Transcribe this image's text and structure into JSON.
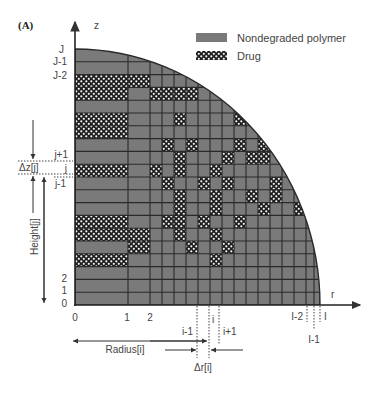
{
  "figure": {
    "panel_label": "(A)",
    "axis_z_label": "z",
    "axis_r_label": "r"
  },
  "legend": {
    "items": [
      {
        "label": "Nondegraded polymer",
        "swatch": "polymer"
      },
      {
        "label": "Drug",
        "swatch": "drug"
      }
    ]
  },
  "colors": {
    "polymer": "#7a7a7a",
    "grid": "#2a2a2a",
    "drug_dark": "#1e1e1e",
    "drug_light": "#f2f2f2",
    "text": "#444444"
  },
  "z_labels": {
    "top": [
      "J",
      "J-1",
      "J-2"
    ],
    "middle": [
      "j+1",
      "j",
      "j-1"
    ],
    "bottom": [
      "2",
      "1",
      "0"
    ]
  },
  "r_labels": {
    "near_origin": [
      "0",
      "1",
      "2"
    ],
    "middle": [
      "i-1",
      "i",
      "i+1"
    ],
    "outer": [
      "I-2",
      "I-1",
      "I"
    ]
  },
  "annotations": {
    "delta_z": "Δz[j]",
    "height": "Height[j]",
    "radius": "Radius[i]",
    "delta_r": "Δr[i]"
  },
  "grid": {
    "origin_x": 75,
    "origin_y": 305,
    "outer_radius_x": 245,
    "outer_radius_y": 256,
    "rows": 20,
    "col_edges": [
      75,
      128,
      150,
      162,
      174,
      186,
      198,
      210,
      222,
      234,
      246,
      258,
      270,
      282,
      294,
      306,
      314,
      320
    ],
    "drug_cells": [
      [
        1,
        17
      ],
      [
        1,
        14
      ],
      [
        1,
        12
      ],
      [
        1,
        11
      ],
      [
        1,
        9
      ],
      [
        1,
        5
      ],
      [
        2,
        1
      ],
      [
        2,
        0
      ],
      [
        2,
        17
      ],
      [
        4,
        14
      ],
      [
        4,
        11
      ],
      [
        3,
        10
      ],
      [
        4,
        10
      ],
      [
        3,
        9
      ],
      [
        5,
        12
      ],
      [
        5,
        16
      ],
      [
        6,
        16
      ],
      [
        6,
        18
      ],
      [
        9,
        15
      ],
      [
        12,
        14
      ],
      [
        3,
        5
      ],
      [
        3,
        4
      ],
      [
        3,
        3
      ],
      [
        3,
        2
      ],
      [
        5,
        4
      ],
      [
        7,
        3
      ],
      [
        9,
        2
      ],
      [
        5,
        9
      ],
      [
        8,
        8
      ],
      [
        9,
        7
      ],
      [
        10,
        6
      ],
      [
        11,
        10
      ],
      [
        6,
        12
      ],
      [
        7,
        11
      ],
      [
        8,
        10
      ],
      [
        8,
        11
      ],
      [
        10,
        12
      ],
      [
        11,
        12
      ],
      [
        12,
        11
      ],
      [
        13,
        9
      ],
      [
        7,
        5
      ],
      [
        8,
        4
      ],
      [
        9,
        4
      ],
      [
        10,
        3
      ],
      [
        11,
        4
      ],
      [
        12,
        4
      ],
      [
        13,
        4
      ],
      [
        14,
        4
      ],
      [
        13,
        3
      ],
      [
        14,
        1
      ],
      [
        15,
        1
      ],
      [
        13,
        0
      ],
      [
        16,
        0
      ],
      [
        11,
        7
      ],
      [
        12,
        7
      ],
      [
        10,
        8
      ],
      [
        7,
        9
      ],
      [
        13,
        6
      ],
      [
        14,
        7
      ],
      [
        15,
        5
      ],
      [
        15,
        8
      ],
      [
        16,
        7
      ]
    ]
  }
}
